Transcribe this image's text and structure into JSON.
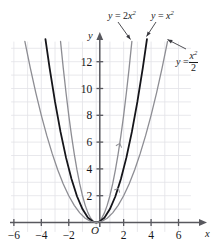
{
  "figure": {
    "kind": "cartesian-plot",
    "background": "#ffffff",
    "grid": {
      "on": true,
      "color": "#e2e2e7",
      "x_min": -6.2,
      "x_max": 6.9,
      "y_min": -0.7,
      "y_max": 13.5,
      "x_step": 1,
      "y_step": 1
    },
    "axes": {
      "color": "#58585e",
      "x_label": "x",
      "y_label": "y",
      "origin_label": "O",
      "x_ticks": [
        -6,
        -4,
        -2,
        2,
        4,
        6
      ],
      "y_ticks": [
        2,
        4,
        6,
        8,
        10,
        12
      ],
      "x_tick_labels": [
        "-6",
        "-4",
        "-2",
        "2",
        "4",
        "6"
      ],
      "y_tick_labels": [
        "2",
        "4",
        "6",
        "8",
        "10",
        "12"
      ]
    },
    "labels": {
      "left": {
        "lhs": "y",
        "eq": "=",
        "coef": "2",
        "base": "x",
        "exp": "2",
        "text": "y = 2x²"
      },
      "middle": {
        "lhs": "y",
        "eq": "=",
        "base": "x",
        "exp": "2",
        "text": "y = x²"
      },
      "right": {
        "lhs": "y",
        "eq": "=",
        "num_base": "x",
        "num_exp": "2",
        "den": "2",
        "text": "y = x²/2"
      }
    }
  },
  "chart_data": {
    "type": "line",
    "title": "",
    "xlabel": "x",
    "ylabel": "y",
    "xlim": [
      -6.2,
      6.9
    ],
    "ylim": [
      -0.7,
      13.5
    ],
    "xticks": [
      -6,
      -4,
      -2,
      0,
      2,
      4,
      6
    ],
    "yticks": [
      2,
      4,
      6,
      8,
      10,
      12
    ],
    "grid": true,
    "legend": "annotations-with-leader-lines",
    "series": [
      {
        "name": "y = 2x²",
        "equation": "y = 2*x^2",
        "color": "#8d8d93",
        "width": 1.3,
        "x": [
          -2.6,
          -2.4,
          -2.2,
          -2.0,
          -1.8,
          -1.6,
          -1.4,
          -1.2,
          -1.0,
          -0.8,
          -0.6,
          -0.4,
          -0.2,
          0,
          0.2,
          0.4,
          0.6,
          0.8,
          1.0,
          1.2,
          1.4,
          1.6,
          1.8,
          2.0,
          2.2,
          2.4,
          2.6
        ],
        "y": [
          13.52,
          11.52,
          9.68,
          8.0,
          6.48,
          5.12,
          3.92,
          2.88,
          2.0,
          1.28,
          0.72,
          0.32,
          0.08,
          0,
          0.08,
          0.32,
          0.72,
          1.28,
          2.0,
          2.88,
          3.92,
          5.12,
          6.48,
          8.0,
          9.68,
          11.52,
          13.52
        ]
      },
      {
        "name": "y = x²",
        "equation": "y = x^2",
        "color": "#15151a",
        "width": 1.8,
        "x": [
          -3.7,
          -3.4,
          -3.0,
          -2.6,
          -2.2,
          -1.8,
          -1.4,
          -1.0,
          -0.6,
          -0.2,
          0,
          0.2,
          0.6,
          1.0,
          1.4,
          1.8,
          2.2,
          2.6,
          3.0,
          3.4,
          3.7
        ],
        "y": [
          13.69,
          11.56,
          9.0,
          6.76,
          4.84,
          3.24,
          1.96,
          1.0,
          0.36,
          0.04,
          0,
          0.04,
          0.36,
          1.0,
          1.96,
          3.24,
          4.84,
          6.76,
          9.0,
          11.56,
          13.69
        ]
      },
      {
        "name": "y = x²/2",
        "equation": "y = x^2/2",
        "color": "#8d8d93",
        "width": 1.3,
        "x": [
          -5.2,
          -4.8,
          -4.4,
          -4.0,
          -3.6,
          -3.2,
          -2.8,
          -2.4,
          -2.0,
          -1.6,
          -1.2,
          -0.8,
          -0.4,
          0,
          0.4,
          0.8,
          1.2,
          1.6,
          2.0,
          2.4,
          2.8,
          3.2,
          3.6,
          4.0,
          4.4,
          4.8,
          5.2
        ],
        "y": [
          13.52,
          11.52,
          9.68,
          8.0,
          6.48,
          5.12,
          3.92,
          2.88,
          2.0,
          1.28,
          0.72,
          0.32,
          0.08,
          0,
          0.08,
          0.32,
          0.72,
          1.28,
          2.0,
          2.88,
          3.92,
          5.12,
          6.48,
          8.0,
          9.68,
          11.52,
          13.52
        ]
      }
    ],
    "annotations": [
      {
        "text": "y = 2x²",
        "points_to_curve": "y = 2x²",
        "at_x": 2.05,
        "at_y": 8.4
      },
      {
        "text": "y = x²",
        "points_to_curve": "y = x²",
        "at_x": 3.6,
        "at_y": 12.9
      },
      {
        "text": "y = x²/2",
        "points_to_curve": "y = x²/2",
        "at_x": 5.05,
        "at_y": 12.8
      }
    ]
  }
}
